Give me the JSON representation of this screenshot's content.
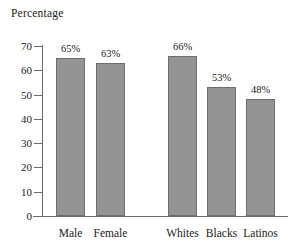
{
  "chart_data": {
    "type": "bar",
    "title": "",
    "ylabel": "Percentage",
    "xlabel": "",
    "categories": [
      "Male",
      "Female",
      "Whites",
      "Blacks",
      "Latinos"
    ],
    "values": [
      65,
      63,
      66,
      53,
      48
    ],
    "value_labels": [
      "65%",
      "63%",
      "66%",
      "53%",
      "48%"
    ],
    "groups": [
      {
        "name": "gender",
        "categories": [
          "Male",
          "Female"
        ]
      },
      {
        "name": "race",
        "categories": [
          "Whites",
          "Blacks",
          "Latinos"
        ]
      }
    ],
    "ylim": [
      0,
      70
    ],
    "ytick_values": [
      0,
      10,
      20,
      30,
      40,
      50,
      60,
      70
    ],
    "ytick_labels": [
      "0",
      "10",
      "20",
      "30",
      "40",
      "50",
      "60",
      "70"
    ],
    "grid": false,
    "legend": null,
    "bar_color": "#949494",
    "bar_edge_color": "#6f6f6f",
    "axis_color": "#6d6d6d",
    "text_color": "#222222",
    "background": "#ffffff"
  },
  "axis": {
    "title": "Percentage"
  },
  "ticks": [
    {
      "label": "70",
      "value": 70
    },
    {
      "label": "60",
      "value": 60
    },
    {
      "label": "50",
      "value": 50
    },
    {
      "label": "40",
      "value": 40
    },
    {
      "label": "30",
      "value": 30
    },
    {
      "label": "20",
      "value": 20
    },
    {
      "label": "10",
      "value": 10
    },
    {
      "label": "0",
      "value": 0
    }
  ],
  "bars": [
    {
      "label": "Male",
      "value": 65,
      "value_label": "65%"
    },
    {
      "label": "Female",
      "value": 63,
      "value_label": "63%"
    },
    {
      "label": "Whites",
      "value": 66,
      "value_label": "66%"
    },
    {
      "label": "Blacks",
      "value": 53,
      "value_label": "53%"
    },
    {
      "label": "Latinos",
      "value": 48,
      "value_label": "48%"
    }
  ]
}
